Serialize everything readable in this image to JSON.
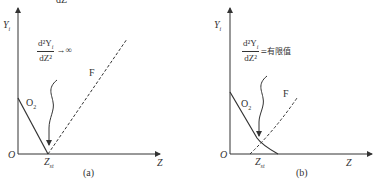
{
  "top_cropped_text": "dZ²",
  "panels": [
    {
      "id": "a",
      "caption": "(a)",
      "y_axis_label": "Y",
      "y_axis_sub": "i",
      "x_axis_label": "Z",
      "origin_label": "O",
      "zst_label": "Z",
      "zst_sub": "st",
      "o2_label": "O",
      "o2_sub": "2",
      "f_label": "F",
      "formula": {
        "num": "d²Y",
        "num_sub": "i",
        "den": "dZ²",
        "rhs": "→∞"
      }
    },
    {
      "id": "b",
      "caption": "(b)",
      "y_axis_label": "Y",
      "y_axis_sub": "i",
      "x_axis_label": "Z",
      "origin_label": "O",
      "zst_label": "Z",
      "zst_sub": "st",
      "o2_label": "O",
      "o2_sub": "2",
      "f_label": "F",
      "formula": {
        "num": "d²Y",
        "num_sub": "i",
        "den": "dZ²",
        "rhs": "=有限值"
      }
    }
  ]
}
